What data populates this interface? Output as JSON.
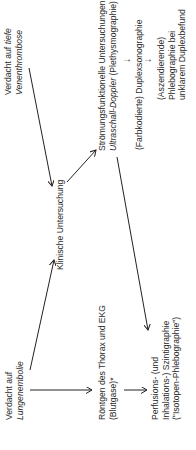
{
  "diagram": {
    "title": "",
    "nodes": {
      "suspicion_dvt": {
        "line1_a": "Verdacht auf ",
        "line1_b": "tiefe",
        "line2": "Venenthrombose"
      },
      "suspicion_pe": {
        "line1": "Verdacht auf",
        "line2": "Lungenembolie"
      },
      "clinical_exam": {
        "label": "Klinische Untersuchung"
      },
      "flow_tests": {
        "line1": "Strömungsfunktionelle Untersuchungen:",
        "line2_a": "Ultraschall-Doppler",
        "line2_b": " (Plethysmographie)"
      },
      "duplex": {
        "label": "(Farbkodierte) Duplexsonographie"
      },
      "phlebo": {
        "line1": "(Aszendierende)",
        "line2": "Phlebographie bei",
        "line3": "unklarem Duplexbefund"
      },
      "xray": {
        "line1": "Röntgen des Thorax und EKG",
        "line2": "(Blutgase)*"
      },
      "scinti": {
        "line1": "Perfusions- (und",
        "line2": "Inhalations-) Szintigraphie",
        "line3": "(\"Isotopen-Phlebographie\")"
      }
    },
    "arrows": {
      "down_1": "→",
      "down_2": "→"
    },
    "edges": [
      {
        "from": "suspicion_dvt",
        "to": "clinical_exam"
      },
      {
        "from": "suspicion_pe",
        "to": "clinical_exam"
      },
      {
        "from": "clinical_exam",
        "to": "flow_tests"
      },
      {
        "from": "suspicion_pe",
        "to": "xray"
      },
      {
        "from": "xray",
        "to": "scinti"
      },
      {
        "from": "flow_tests",
        "to": "scinti"
      },
      {
        "from": "flow_tests",
        "to": "duplex"
      },
      {
        "from": "duplex",
        "to": "phlebo"
      }
    ],
    "line_color": "#222222"
  }
}
